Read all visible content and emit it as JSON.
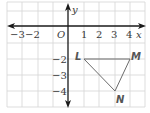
{
  "diagram": {
    "type": "coordinate-plane",
    "axes": {
      "x_label": "x",
      "y_label": "y",
      "origin_label": "O",
      "x_ticks": [
        "−3",
        "−2",
        "1",
        "2",
        "3",
        "4"
      ],
      "y_ticks": [
        "−2",
        "−3",
        "−4"
      ]
    },
    "points": [
      {
        "label": "L",
        "x": 1,
        "y": -2
      },
      {
        "label": "M",
        "x": 4,
        "y": -2
      },
      {
        "label": "N",
        "x": 3,
        "y": -4
      }
    ],
    "polygon": "triangle LMN",
    "colors": {
      "grid": "#d4d4d4",
      "axis": "#1a1a1a",
      "triangle": "#6b6b6b",
      "labels": "#3a3a3a"
    }
  }
}
